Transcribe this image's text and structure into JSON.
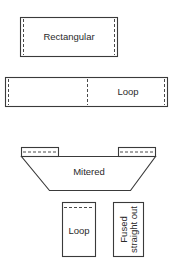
{
  "diagram": {
    "title": "",
    "shapes": [
      {
        "id": "rectangular",
        "label": "Rectangular",
        "type": "rectangle",
        "seam_lines": "vertical dashed near left and right edges"
      },
      {
        "id": "loop-long",
        "label": "Loop",
        "type": "long rectangle",
        "seam_lines": "vertical dashed near left edge, center, and right edge"
      },
      {
        "id": "mitered",
        "label": "Mitered",
        "type": "trapezoid with tabs",
        "seam_lines": "horizontal dashed in left and right tabs"
      },
      {
        "id": "loop-small",
        "label": "Loop",
        "type": "tall rectangle",
        "seam_lines": "horizontal dashed near top"
      },
      {
        "id": "fused",
        "label_line1": "Fused",
        "label_line2": "straight out",
        "type": "tall rectangle",
        "text_orientation": "rotated 90° counter-clockwise"
      }
    ]
  },
  "colors": {
    "stroke": "#3a3a3a",
    "background": "#ffffff",
    "text": "#2a2a2a"
  }
}
